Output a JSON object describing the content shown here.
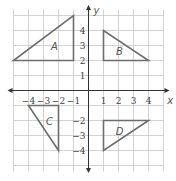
{
  "diagram": {
    "type": "coordinate-plane",
    "x_axis_label": "x",
    "y_axis_label": "y",
    "x_ticks": [
      "-4",
      "-3",
      "-2",
      "-1",
      "1",
      "2",
      "3",
      "4"
    ],
    "y_ticks": [
      "4",
      "3",
      "2",
      "1",
      "-2",
      "-3",
      "-4"
    ],
    "range": {
      "x": [
        -5,
        5
      ],
      "y": [
        -5,
        5
      ]
    },
    "colors": {
      "grid": "#c8c8c8",
      "axis": "#333333",
      "shape": "#6e6e6e"
    },
    "shapes": [
      {
        "label": "A",
        "vertices": [
          [
            -5,
            2
          ],
          [
            -1,
            2
          ],
          [
            -1,
            5
          ]
        ]
      },
      {
        "label": "B",
        "vertices": [
          [
            1,
            4
          ],
          [
            1,
            2
          ],
          [
            4,
            2
          ]
        ]
      },
      {
        "label": "C",
        "vertices": [
          [
            -4,
            -1
          ],
          [
            -2,
            -1
          ],
          [
            -2,
            -4
          ]
        ]
      },
      {
        "label": "D",
        "vertices": [
          [
            1,
            -2
          ],
          [
            4,
            -2
          ],
          [
            1,
            -4
          ]
        ]
      }
    ]
  }
}
